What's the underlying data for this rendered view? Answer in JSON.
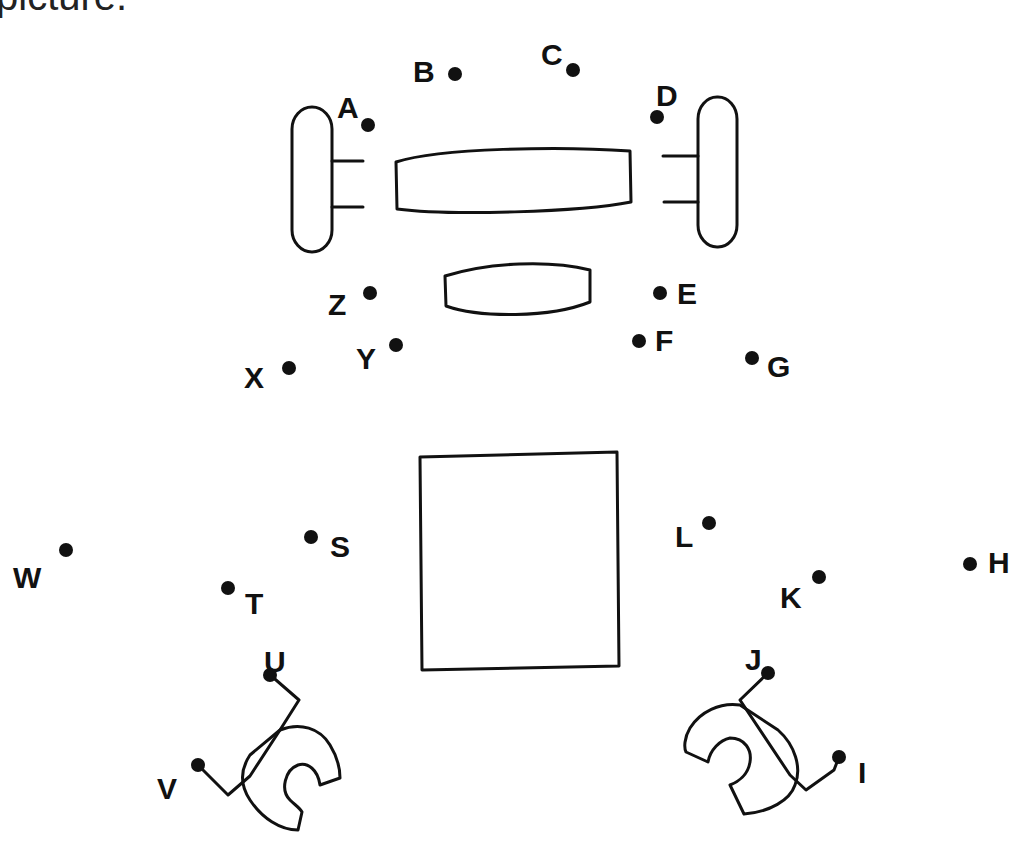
{
  "caption": "picture.",
  "colors": {
    "ink": "#111111",
    "background": "#ffffff"
  },
  "dots": [
    {
      "label": "A",
      "x": 368,
      "y": 125,
      "lx": 337,
      "ly": 106
    },
    {
      "label": "B",
      "x": 455,
      "y": 74,
      "lx": 413,
      "ly": 70
    },
    {
      "label": "C",
      "x": 573,
      "y": 70,
      "lx": 541,
      "ly": 53
    },
    {
      "label": "D",
      "x": 657,
      "y": 117,
      "lx": 656,
      "ly": 94
    },
    {
      "label": "E",
      "x": 660,
      "y": 293,
      "lx": 677,
      "ly": 292
    },
    {
      "label": "F",
      "x": 639,
      "y": 341,
      "lx": 655,
      "ly": 339
    },
    {
      "label": "G",
      "x": 752,
      "y": 358,
      "lx": 767,
      "ly": 365
    },
    {
      "label": "H",
      "x": 970,
      "y": 564,
      "lx": 988,
      "ly": 561
    },
    {
      "label": "I",
      "x": 839,
      "y": 757,
      "lx": 858,
      "ly": 771
    },
    {
      "label": "J",
      "x": 768,
      "y": 673,
      "lx": 745,
      "ly": 658
    },
    {
      "label": "K",
      "x": 819,
      "y": 577,
      "lx": 780,
      "ly": 596
    },
    {
      "label": "L",
      "x": 709,
      "y": 523,
      "lx": 675,
      "ly": 535
    },
    {
      "label": "S",
      "x": 311,
      "y": 537,
      "lx": 330,
      "ly": 545
    },
    {
      "label": "T",
      "x": 228,
      "y": 588,
      "lx": 245,
      "ly": 602
    },
    {
      "label": "U",
      "x": 270,
      "y": 675,
      "lx": 264,
      "ly": 660
    },
    {
      "label": "V",
      "x": 198,
      "y": 765,
      "lx": 157,
      "ly": 787
    },
    {
      "label": "W",
      "x": 66,
      "y": 550,
      "lx": 13,
      "ly": 576
    },
    {
      "label": "X",
      "x": 289,
      "y": 368,
      "lx": 244,
      "ly": 376
    },
    {
      "label": "Y",
      "x": 396,
      "y": 345,
      "lx": 356,
      "ly": 357
    },
    {
      "label": "Z",
      "x": 370,
      "y": 293,
      "lx": 328,
      "ly": 303
    }
  ]
}
